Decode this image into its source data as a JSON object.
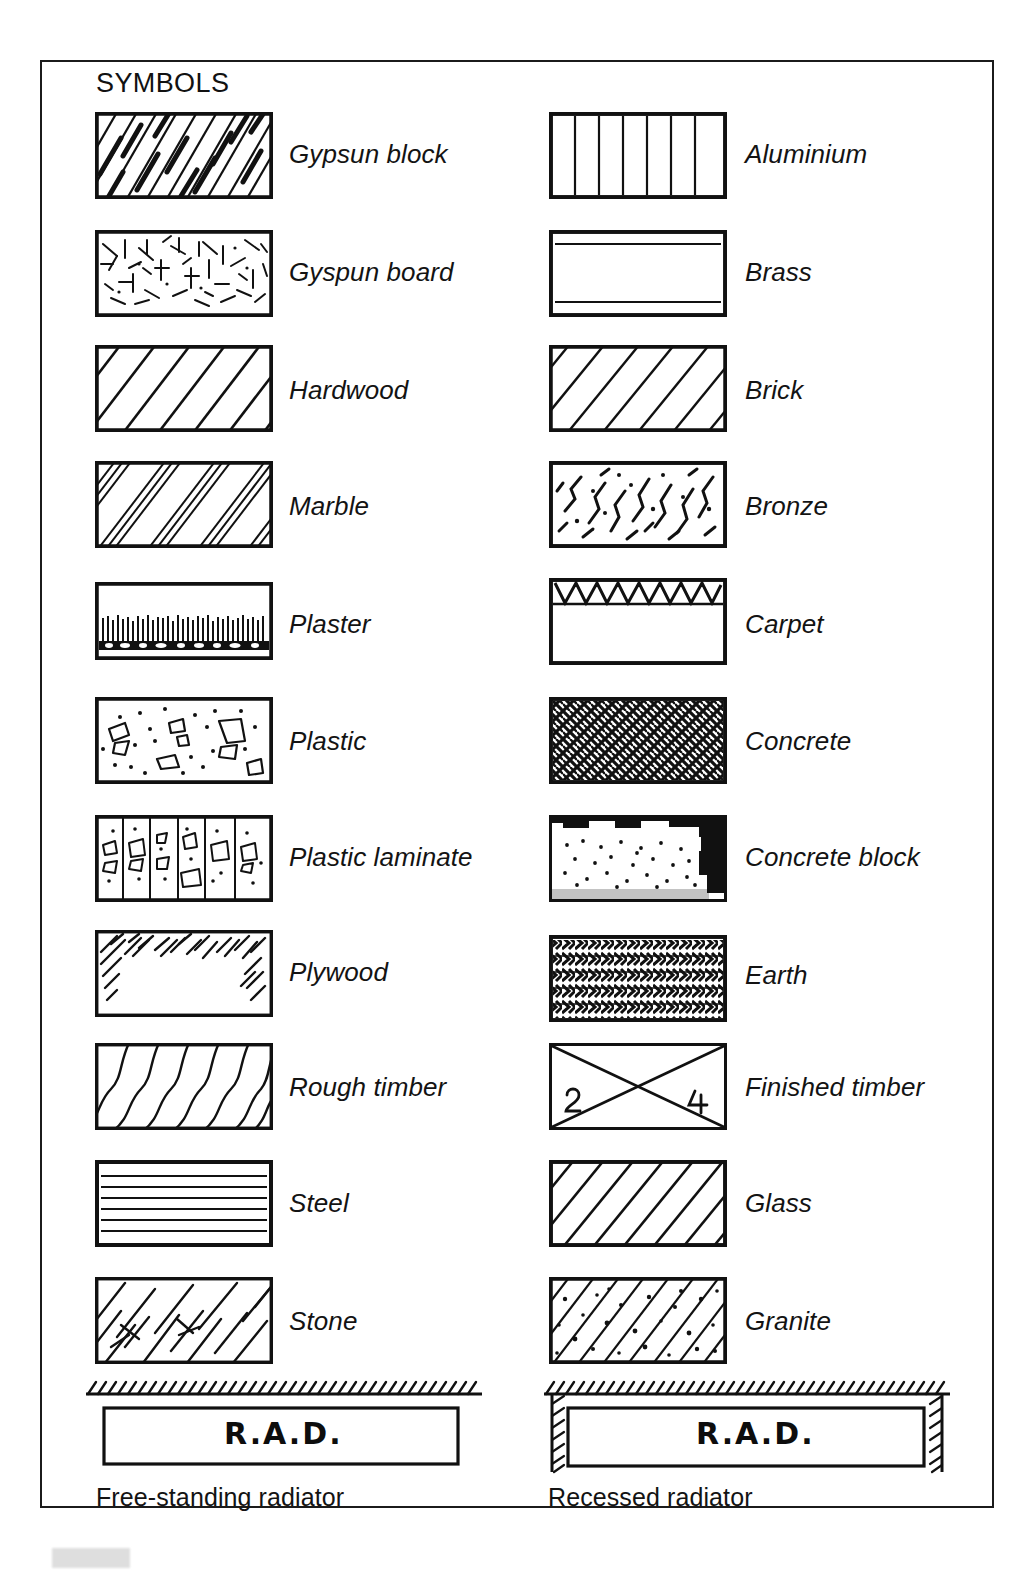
{
  "page": {
    "title": "SYMBOLS",
    "border_color": "#1b1b1b",
    "ink_color": "#111111",
    "background": "#ffffff"
  },
  "legend": {
    "left_column": [
      {
        "label": "Gypsun block",
        "pattern": "dashed-diagonal-hatch"
      },
      {
        "label": "Gyspun board",
        "pattern": "random-tick-texture"
      },
      {
        "label": "Hardwood",
        "pattern": "wide-diagonal-hatch"
      },
      {
        "label": "Marble",
        "pattern": "paired-diagonal-hatch"
      },
      {
        "label": "Plaster",
        "pattern": "dense-vertical-comb-band"
      },
      {
        "label": "Plastic",
        "pattern": "aggregate-shapes-dots"
      },
      {
        "label": "Plastic laminate",
        "pattern": "vertical-bands-aggregate"
      },
      {
        "label": "Plywood",
        "pattern": "scratchy-edge-strokes"
      },
      {
        "label": "Rough timber",
        "pattern": "wavy-grain-diagonals"
      },
      {
        "label": "Steel",
        "pattern": "horizontal-lines"
      },
      {
        "label": "Stone",
        "pattern": "broken-diagonal-blocks"
      }
    ],
    "right_column": [
      {
        "label": "Aluminium",
        "pattern": "vertical-lines"
      },
      {
        "label": "Brass",
        "pattern": "two-horizontal-lines"
      },
      {
        "label": "Brick",
        "pattern": "diagonal-hatch"
      },
      {
        "label": "Bronze",
        "pattern": "crack-marks"
      },
      {
        "label": "Carpet",
        "pattern": "zigzag-top-band"
      },
      {
        "label": "Concrete",
        "pattern": "dense-cross-mesh"
      },
      {
        "label": "Concrete block",
        "pattern": "dotted-dark-edges"
      },
      {
        "label": "Earth",
        "pattern": "chevron-rows"
      },
      {
        "label": "Finished timber",
        "pattern": "cross-diagonals-numbered",
        "marks": [
          "2",
          "4"
        ]
      },
      {
        "label": "Glass",
        "pattern": "diagonal-hatch"
      },
      {
        "label": "Granite",
        "pattern": "diagonal-hatch-speckled"
      }
    ]
  },
  "radiators": [
    {
      "box_text": "R.A.D.",
      "caption": "Free-standing radiator",
      "style": "free-standing"
    },
    {
      "box_text": "R.A.D.",
      "caption": "Recessed radiator",
      "style": "recessed"
    }
  ]
}
